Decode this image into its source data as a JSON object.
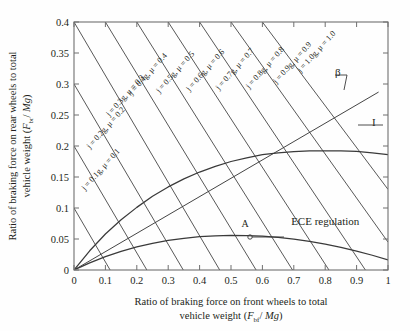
{
  "figure": {
    "title": "",
    "background_color": "#fefefe",
    "line_color": "#3a3a3a",
    "text_color": "#231f20"
  },
  "axes": {
    "x": {
      "label_line1": "Ratio of braking force on front wheels to total",
      "label_line2_pre": "vehicle weight (",
      "label_line2_var": "F",
      "label_line2_sub": "bf",
      "label_line2_mid": "/ ",
      "label_line2_var2": "Mg",
      "label_line2_post": ")",
      "ticks": [
        "0",
        "0.1",
        "0.2",
        "0.3",
        "0.4",
        "0.5",
        "0.6",
        "0.7",
        "0.8",
        "0.9",
        "1"
      ],
      "tick_values": [
        0,
        0.1,
        0.2,
        0.3,
        0.4,
        0.5,
        0.6,
        0.7,
        0.8,
        0.9,
        1.0
      ],
      "min": 0,
      "max": 1.0
    },
    "y": {
      "label_line1": "Ratio of braking force on rear wheels to total",
      "label_line2_pre": "vehicle weight (",
      "label_line2_var": "F",
      "label_line2_sub": "br",
      "label_line2_mid": "/ ",
      "label_line2_var2": "Mg",
      "label_line2_post": ")",
      "ticks": [
        "0",
        "0.05",
        "0.1",
        "0.15",
        "0.2",
        "0.25",
        "0.3",
        "0.35",
        "0.4"
      ],
      "tick_values": [
        0,
        0.05,
        0.1,
        0.15,
        0.2,
        0.25,
        0.3,
        0.35,
        0.4
      ],
      "min": 0,
      "max": 0.4
    }
  },
  "chart_data": {
    "type": "line",
    "title": "",
    "xlabel": "Ratio of braking force on front wheels to total vehicle weight (Fbf / Mg)",
    "ylabel": "Ratio of braking force on rear wheels to total vehicle weight (Fbr / Mg)",
    "xlim": [
      0,
      1.0
    ],
    "ylim": [
      0,
      0.4
    ],
    "grid": false,
    "legend": "none",
    "annotations": [
      {
        "name": "beta-line-label",
        "text": "β",
        "x": 0.84,
        "y": 0.313
      },
      {
        "name": "i-curve-label",
        "text": "I",
        "x": 0.955,
        "y": 0.232
      },
      {
        "name": "ece-regulation-label",
        "text": "ECE regulation",
        "x": 0.8,
        "y": 0.073
      },
      {
        "name": "point-a-label",
        "text": "A",
        "x": 0.545,
        "y": 0.069
      }
    ],
    "series": [
      {
        "name": "I",
        "description": "Ideal braking force distribution curve",
        "points": [
          [
            0.0,
            0.0
          ],
          [
            0.05,
            0.031
          ],
          [
            0.1,
            0.058
          ],
          [
            0.15,
            0.081
          ],
          [
            0.2,
            0.101
          ],
          [
            0.25,
            0.119
          ],
          [
            0.3,
            0.134
          ],
          [
            0.35,
            0.147
          ],
          [
            0.4,
            0.158
          ],
          [
            0.45,
            0.167
          ],
          [
            0.5,
            0.175
          ],
          [
            0.55,
            0.181
          ],
          [
            0.6,
            0.186
          ],
          [
            0.65,
            0.189
          ],
          [
            0.7,
            0.191
          ],
          [
            0.75,
            0.192
          ],
          [
            0.8,
            0.192
          ],
          [
            0.85,
            0.192
          ],
          [
            0.9,
            0.1915
          ],
          [
            0.95,
            0.189
          ],
          [
            1.0,
            0.186
          ]
        ]
      },
      {
        "name": "beta",
        "description": "Actual braking force distribution line (constant ratio)",
        "points": [
          [
            0.0,
            0.0
          ],
          [
            0.97,
            0.287
          ]
        ]
      },
      {
        "name": "ECE regulation",
        "description": "ECE regulation lower boundary curve",
        "points": [
          [
            0.0,
            0.0
          ],
          [
            0.05,
            0.0115
          ],
          [
            0.1,
            0.0215
          ],
          [
            0.15,
            0.03
          ],
          [
            0.2,
            0.0372
          ],
          [
            0.25,
            0.043
          ],
          [
            0.3,
            0.0477
          ],
          [
            0.35,
            0.0512
          ],
          [
            0.4,
            0.0537
          ],
          [
            0.45,
            0.0552
          ],
          [
            0.5,
            0.0558
          ],
          [
            0.55,
            0.0556
          ],
          [
            0.6,
            0.0545
          ],
          [
            0.65,
            0.0526
          ],
          [
            0.7,
            0.0498
          ],
          [
            0.75,
            0.0462
          ],
          [
            0.8,
            0.0418
          ],
          [
            0.85,
            0.0366
          ],
          [
            0.9,
            0.0306
          ],
          [
            0.95,
            0.0238
          ],
          [
            1.0,
            0.0162
          ]
        ]
      }
    ],
    "f_lines": {
      "description": "Family of constant deceleration / adhesion (f) lines of the form Fbr = j - Fbf, drawn from upper-left to lower-right",
      "lines": [
        {
          "label": "j = 0.1g, μ = 0.1",
          "j": 0.1,
          "mu": 0.1,
          "x1": 0.0,
          "y1": 0.1,
          "x2": 0.115,
          "y2": 0.0,
          "label_x": 0.035,
          "label_y": 0.128,
          "angle": -48
        },
        {
          "label": "j = 0.2g, μ = 0.2",
          "j": 0.2,
          "mu": 0.2,
          "x1": 0.0,
          "y1": 0.2,
          "x2": 0.232,
          "y2": 0.0,
          "label_x": 0.051,
          "label_y": 0.195,
          "angle": -48
        },
        {
          "label": "j = 0.3g, μ = 0.3",
          "j": 0.3,
          "mu": 0.3,
          "x1": 0.0,
          "y1": 0.3,
          "x2": 0.348,
          "y2": 0.0,
          "label_x": 0.113,
          "label_y": 0.247,
          "angle": -48
        },
        {
          "label": "j = 0.4g, μ = 0.4",
          "j": 0.4,
          "mu": 0.4,
          "x1": 0.0,
          "y1": 0.4,
          "x2": 0.464,
          "y2": 0.0,
          "label_x": 0.185,
          "label_y": 0.282,
          "angle": -48
        },
        {
          "label": "j = 0.5g, μ = 0.5",
          "j": 0.5,
          "mu": 0.5,
          "x1": 0.1,
          "y1": 0.4,
          "x2": 0.58,
          "y2": 0.0,
          "label_x": 0.272,
          "label_y": 0.285,
          "angle": -48
        },
        {
          "label": "j = 0.6g, μ = 0.6",
          "j": 0.6,
          "mu": 0.6,
          "x1": 0.2,
          "y1": 0.4,
          "x2": 0.696,
          "y2": 0.0,
          "label_x": 0.368,
          "label_y": 0.288,
          "angle": -48
        },
        {
          "label": "j = 0.7g, μ = 0.7",
          "j": 0.7,
          "mu": 0.7,
          "x1": 0.3,
          "y1": 0.4,
          "x2": 0.812,
          "y2": 0.0,
          "label_x": 0.462,
          "label_y": 0.29,
          "angle": -48
        },
        {
          "label": "j = 0.8g, μ = 0.8",
          "j": 0.8,
          "mu": 0.8,
          "x1": 0.4,
          "y1": 0.4,
          "x2": 0.928,
          "y2": 0.0,
          "label_x": 0.558,
          "label_y": 0.292,
          "angle": -48
        },
        {
          "label": "j = 0.9g, μ = 0.9",
          "j": 0.9,
          "mu": 0.9,
          "x1": 0.5,
          "y1": 0.4,
          "x2": 1.0,
          "y2": 0.045,
          "label_x": 0.645,
          "label_y": 0.3,
          "angle": -48
        },
        {
          "label": "j = 1.0g, μ = 1.0",
          "j": 1.0,
          "mu": 1.0,
          "x1": 0.6,
          "y1": 0.4,
          "x2": 1.0,
          "y2": 0.13,
          "label_x": 0.722,
          "label_y": 0.318,
          "angle": -48
        }
      ]
    }
  }
}
